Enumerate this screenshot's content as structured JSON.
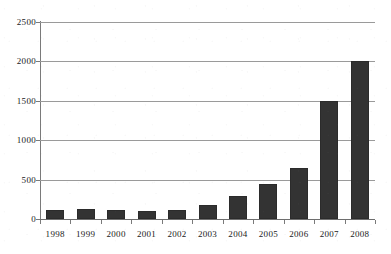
{
  "chart_data": {
    "type": "bar",
    "title": "",
    "subtitle": "",
    "xlabel": "",
    "ylabel": "",
    "categories": [
      "1998",
      "1999",
      "2000",
      "2001",
      "2002",
      "2003",
      "2004",
      "2005",
      "2006",
      "2007",
      "2008"
    ],
    "values": [
      120,
      130,
      120,
      100,
      110,
      180,
      290,
      450,
      650,
      1500,
      2000
    ],
    "ylim": [
      0,
      2500
    ],
    "yticks": [
      0,
      500,
      1000,
      1500,
      2000,
      2500
    ],
    "ytick_labels": [
      "0",
      "500",
      "1000",
      "1500",
      "2000",
      "2500"
    ],
    "grid": true,
    "grid_axis": "y",
    "legend": false,
    "legend_position": "none",
    "series": [
      {
        "name": "",
        "color": "#333333",
        "values": [
          120,
          130,
          120,
          100,
          110,
          180,
          290,
          450,
          650,
          1500,
          2000
        ]
      }
    ]
  },
  "style": {
    "bar_color": "#333333",
    "bar_edge_color": "#2b2b2b",
    "grid_color": "#9a9a9a",
    "axis_color": "#7a7a7a",
    "text_color": "#1a1a1a",
    "background": "#ffffff"
  }
}
